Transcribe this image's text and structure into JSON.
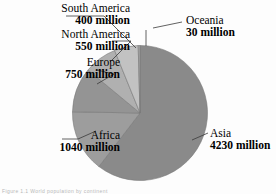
{
  "figure": {
    "caption_note": "Figure 1.1 World population by continent"
  },
  "chart_data": {
    "type": "pie",
    "title": "",
    "xlabel": "",
    "ylabel": "",
    "units": "million",
    "total": 7000,
    "start_angle_deg": 0,
    "direction": "clockwise",
    "legend": "none (direct labels with leader lines)",
    "grid": false,
    "categories": [
      "Asia",
      "Africa",
      "Europe",
      "North America",
      "South America",
      "Oceania"
    ],
    "values": [
      4230,
      1040,
      750,
      550,
      400,
      30
    ],
    "slices": [
      {
        "label": "Asia",
        "value": 4230,
        "value_text": "4230 million",
        "color": "#8a8a8a",
        "angle_deg": 217.5
      },
      {
        "label": "Africa",
        "value": 1040,
        "value_text": "1040 million",
        "color": "#9d9d9d",
        "angle_deg": 53.5
      },
      {
        "label": "Europe",
        "value": 750,
        "value_text": "750 million",
        "color": "#949494",
        "angle_deg": 38.6
      },
      {
        "label": "North America",
        "value": 550,
        "value_text": "550 million",
        "color": "#b0b0b0",
        "angle_deg": 28.3
      },
      {
        "label": "South America",
        "value": 400,
        "value_text": "400 million",
        "color": "#c2c2c2",
        "angle_deg": 20.6
      },
      {
        "label": "Oceania",
        "value": 30,
        "value_text": "30 million",
        "color": "#a8a8a8",
        "angle_deg": 1.5
      }
    ]
  },
  "labels": {
    "south_america": {
      "name": "South America",
      "value": "400 million"
    },
    "north_america": {
      "name": "North America",
      "value": "550 million"
    },
    "europe": {
      "name": "Europe",
      "value": "750 million"
    },
    "africa": {
      "name": "Africa",
      "value": "1040 million"
    },
    "oceania": {
      "name": "Oceania",
      "value": "30 million"
    },
    "asia": {
      "name": "Asia",
      "value": "4230 million"
    }
  },
  "colors": {
    "background": "#fdfdfd",
    "text": "#000000",
    "leader_line": "#3a3a3a",
    "pie_outline": "#787878"
  }
}
